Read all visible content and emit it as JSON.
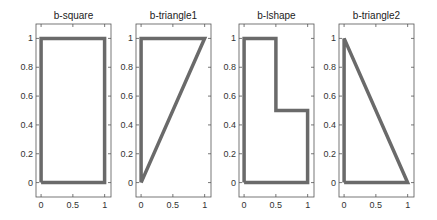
{
  "chart_data": [
    {
      "type": "line",
      "title": "b-square",
      "x": [
        0,
        1,
        1,
        0,
        0
      ],
      "y": [
        0,
        0,
        1,
        1,
        0
      ],
      "xlim": [
        -0.08,
        1.1
      ],
      "ylim": [
        -0.1,
        1.1
      ],
      "xticks": [
        "0",
        "0.5",
        "1"
      ],
      "yticks": [
        "0",
        "0.2",
        "0.4",
        "0.6",
        "0.8",
        "1"
      ],
      "xlabel": "",
      "ylabel": "",
      "grid": false
    },
    {
      "type": "line",
      "title": "b-triangle1",
      "x": [
        0,
        1,
        0,
        0
      ],
      "y": [
        0,
        1,
        1,
        0
      ],
      "xlim": [
        -0.08,
        1.1
      ],
      "ylim": [
        -0.1,
        1.1
      ],
      "xticks": [
        "0",
        "0.5",
        "1"
      ],
      "yticks": [
        "0",
        "0.2",
        "0.4",
        "0.6",
        "0.8",
        "1"
      ],
      "xlabel": "",
      "ylabel": "",
      "grid": false
    },
    {
      "type": "line",
      "title": "b-lshape",
      "x": [
        0,
        1,
        1,
        0.5,
        0.5,
        0,
        0
      ],
      "y": [
        0,
        0,
        0.5,
        0.5,
        1,
        1,
        0
      ],
      "xlim": [
        -0.08,
        1.1
      ],
      "ylim": [
        -0.1,
        1.1
      ],
      "xticks": [
        "0",
        "0.5",
        "1"
      ],
      "yticks": [
        "0",
        "0.2",
        "0.4",
        "0.6",
        "0.8",
        "1"
      ],
      "xlabel": "",
      "ylabel": "",
      "grid": false
    },
    {
      "type": "line",
      "title": "b-triangle2",
      "x": [
        0,
        1,
        0,
        0
      ],
      "y": [
        0,
        0,
        1,
        0
      ],
      "xlim": [
        -0.08,
        1.1
      ],
      "ylim": [
        -0.1,
        1.1
      ],
      "xticks": [
        "0",
        "0.5",
        "1"
      ],
      "yticks": [
        "0",
        "0.2",
        "0.4",
        "0.6",
        "0.8",
        "1"
      ],
      "xlabel": "",
      "ylabel": "",
      "grid": false
    }
  ],
  "style": {
    "line_color": "#6a6a6a",
    "axis_color": "#555555"
  }
}
